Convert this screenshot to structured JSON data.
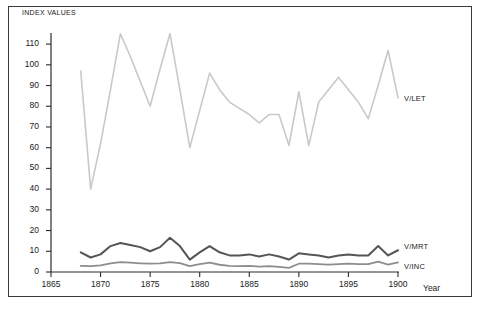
{
  "figure": {
    "background": "#ffffff",
    "frame_color": "#3a3a3a"
  },
  "axis_titles": {
    "y": "INDEX VALUES",
    "x": "Year"
  },
  "series_labels": {
    "vlet": "V/LET",
    "vmrt": "V/MRT",
    "vinc": "V/INC"
  },
  "chart_data": {
    "type": "line",
    "title": "",
    "subtitle": "",
    "xlabel": "Year",
    "ylabel": "INDEX VALUES",
    "xlim": [
      1865,
      1901
    ],
    "ylim": [
      0,
      118
    ],
    "xticks": [
      1865,
      1870,
      1875,
      1880,
      1885,
      1890,
      1895,
      1900
    ],
    "yticks": [
      0,
      10,
      20,
      30,
      40,
      50,
      60,
      70,
      80,
      90,
      100,
      110
    ],
    "grid": false,
    "legend": "inline-right",
    "x": [
      1868,
      1869,
      1870,
      1871,
      1872,
      1873,
      1874,
      1875,
      1876,
      1877,
      1878,
      1879,
      1880,
      1881,
      1882,
      1883,
      1884,
      1885,
      1886,
      1887,
      1888,
      1889,
      1890,
      1891,
      1892,
      1893,
      1894,
      1895,
      1896,
      1897,
      1898,
      1899,
      1900
    ],
    "series": [
      {
        "name": "V/LET",
        "color": "#c9c9c9",
        "width": 1.6,
        "values": [
          97,
          40,
          62,
          88,
          115,
          104,
          92,
          80,
          98,
          115,
          88,
          60,
          78,
          96,
          88,
          82,
          79,
          76,
          72,
          76,
          76,
          61,
          87,
          61,
          82,
          88,
          94,
          88,
          82,
          74,
          90,
          107,
          84
        ]
      },
      {
        "name": "V/MRT",
        "color": "#555555",
        "width": 2.0,
        "values": [
          9.5,
          7.0,
          8.5,
          12.5,
          14.0,
          13.0,
          12.0,
          10.0,
          12.0,
          16.5,
          12.5,
          6.0,
          9.5,
          12.5,
          9.5,
          8.0,
          8.0,
          8.5,
          7.5,
          8.5,
          7.5,
          6.0,
          9.0,
          8.5,
          8.0,
          7.0,
          8.0,
          8.5,
          8.0,
          8.0,
          12.5,
          8.0,
          10.5
        ]
      },
      {
        "name": "V/INC",
        "color": "#8d8d8d",
        "width": 1.8,
        "values": [
          3.0,
          2.8,
          3.2,
          4.2,
          4.8,
          4.5,
          4.2,
          4.0,
          4.2,
          4.8,
          4.3,
          2.8,
          3.8,
          4.5,
          3.5,
          3.0,
          2.8,
          3.0,
          2.6,
          2.8,
          2.5,
          2.0,
          4.0,
          4.0,
          3.8,
          3.6,
          3.8,
          4.0,
          3.8,
          3.8,
          5.0,
          3.6,
          4.6
        ]
      }
    ]
  }
}
